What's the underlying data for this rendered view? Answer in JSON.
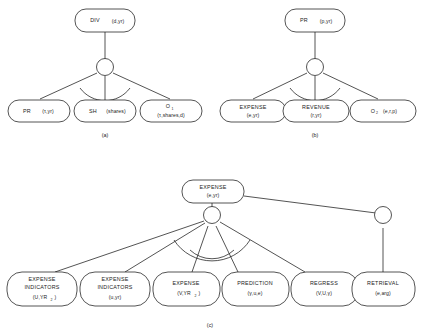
{
  "figure": {
    "background_color": "#ffffff",
    "stroke_color": "#1b1b1b"
  },
  "diagrams": [
    {
      "id": "a",
      "caption": "(a)",
      "root": {
        "name": "DIV",
        "args": "(d,yr)"
      },
      "junction": {
        "type": "and-junction"
      },
      "children": [
        {
          "name": "PR",
          "args": "(τ,yr)"
        },
        {
          "name": "SH",
          "args": "(shares)"
        },
        {
          "name": "O",
          "sub": "1",
          "args": "(τ,shares,d)"
        }
      ]
    },
    {
      "id": "b",
      "caption": "(b)",
      "root": {
        "name": "PR",
        "args": "(p,yr)"
      },
      "junction": {
        "type": "and-junction"
      },
      "children": [
        {
          "name": "EXPENSE",
          "args": "(e,yr)"
        },
        {
          "name": "REVENUE",
          "args": "(r,yr)"
        },
        {
          "name": "O",
          "sub": "2",
          "args": "(e,r,p)"
        }
      ]
    },
    {
      "id": "c",
      "caption": "(c)",
      "root": {
        "name": "EXPENSE",
        "args": "(e,yr)"
      },
      "junctions": [
        {
          "type": "and-junction"
        },
        {
          "type": "or-junction"
        }
      ],
      "children": [
        {
          "name": "EXPENSE INDICATORS",
          "args": "(U,YR",
          "sub": "2",
          "args_tail": ")"
        },
        {
          "name": "EXPENSE INDICATORS",
          "args": "(u,yr)"
        },
        {
          "name": "EXPENSE",
          "args": "(V,YR",
          "sub": "2",
          "args_tail": ")"
        },
        {
          "name": "PREDICTION",
          "args": "(γ,u,e)"
        },
        {
          "name": "REGRESS",
          "args": "(V,U,γ)"
        },
        {
          "name": "RETRIEVAL",
          "args": "(e,arg)"
        }
      ]
    }
  ]
}
